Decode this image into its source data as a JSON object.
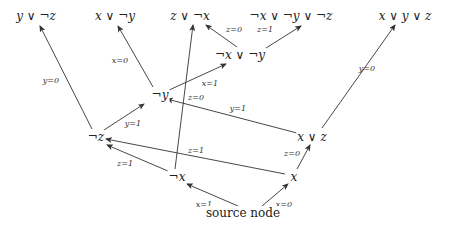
{
  "diagram": {
    "type": "decision-graph",
    "nodes": [
      {
        "id": "n_y_or_notz",
        "label": "y ∨ ¬z",
        "x": 36,
        "y": 16
      },
      {
        "id": "n_x_or_noty",
        "label": "x ∨ ¬y",
        "x": 115,
        "y": 16
      },
      {
        "id": "n_z_or_notx",
        "label": "z ∨ ¬x",
        "x": 190,
        "y": 16
      },
      {
        "id": "n_notx_noty_notz",
        "label": "¬x ∨ ¬y ∨ ¬z",
        "x": 291,
        "y": 16
      },
      {
        "id": "n_x_y_z",
        "label": "x ∨ y ∨ z",
        "x": 405,
        "y": 16
      },
      {
        "id": "n_notx_noty",
        "label": "¬x ∨ ¬y",
        "x": 240,
        "y": 55
      },
      {
        "id": "n_noty",
        "label": "¬y",
        "x": 160,
        "y": 95
      },
      {
        "id": "n_x_or_z",
        "label": "x ∨ z",
        "x": 312,
        "y": 137
      },
      {
        "id": "n_notz",
        "label": "¬z",
        "x": 96,
        "y": 137
      },
      {
        "id": "n_x",
        "label": "x",
        "x": 294,
        "y": 177
      },
      {
        "id": "n_notx",
        "label": "¬x",
        "x": 177,
        "y": 177
      },
      {
        "id": "n_source",
        "label": "source node",
        "x": 243,
        "y": 213,
        "plain": true
      }
    ],
    "edges": [
      {
        "from": "n_source",
        "to": "n_notx",
        "label": "x=1",
        "x1": 238,
        "y1": 206,
        "x2": 187,
        "y2": 184,
        "lx": 204,
        "ly": 205
      },
      {
        "from": "n_source",
        "to": "n_x",
        "label": "x=0",
        "x1": 262,
        "y1": 206,
        "x2": 288,
        "y2": 184,
        "lx": 284,
        "ly": 205
      },
      {
        "from": "n_x",
        "to": "n_x_or_z",
        "label": "z=0",
        "x1": 297,
        "y1": 169,
        "x2": 310,
        "y2": 145,
        "lx": 292,
        "ly": 154
      },
      {
        "from": "n_notx",
        "to": "n_notz",
        "label": "z=1",
        "x1": 168,
        "y1": 171,
        "x2": 107,
        "y2": 145,
        "lx": 125,
        "ly": 164
      },
      {
        "from": "n_x",
        "to": "n_notz",
        "label": "z=1",
        "x1": 285,
        "y1": 174,
        "x2": 106,
        "y2": 139,
        "lx": 196,
        "ly": 151
      },
      {
        "from": "n_notx",
        "to": "n_z_or_notx",
        "label": "",
        "x1": 175,
        "y1": 169,
        "x2": 193,
        "y2": 25,
        "lx": 0,
        "ly": 0
      },
      {
        "from": "n_notz",
        "to": "n_noty",
        "label": "y=1",
        "x1": 104,
        "y1": 130,
        "x2": 144,
        "y2": 104,
        "lx": 133,
        "ly": 124
      },
      {
        "from": "n_notz",
        "to": "n_y_or_notz",
        "label": "y=0",
        "x1": 92,
        "y1": 129,
        "x2": 40,
        "y2": 26,
        "lx": 51,
        "ly": 81
      },
      {
        "from": "n_x_or_z",
        "to": "n_noty",
        "label": "y=1",
        "x1": 297,
        "y1": 133,
        "x2": 167,
        "y2": 99,
        "lx": 238,
        "ly": 109
      },
      {
        "from": "n_x_or_z",
        "to": "n_x_y_z",
        "label": "y=0",
        "x1": 322,
        "y1": 128,
        "x2": 395,
        "y2": 25,
        "lx": 367,
        "ly": 69
      },
      {
        "from": "n_noty",
        "to": "n_x_or_noty",
        "label": "x=0",
        "x1": 153,
        "y1": 87,
        "x2": 118,
        "y2": 26,
        "lx": 120,
        "ly": 61
      },
      {
        "from": "n_noty",
        "to": "n_notx_noty",
        "label": "x=1",
        "x1": 167,
        "y1": 91,
        "x2": 226,
        "y2": 64,
        "lx": 210,
        "ly": 84
      },
      {
        "from": "n_notx_noty",
        "to": "n_z_or_notx",
        "label": "z=0",
        "x1": 237,
        "y1": 47,
        "x2": 206,
        "y2": 25,
        "lx": 234,
        "ly": 30
      },
      {
        "from": "n_notx_noty",
        "to": "n_notx_noty_notz",
        "label": "z=1",
        "x1": 266,
        "y1": 48,
        "x2": 301,
        "y2": 26,
        "lx": 265,
        "ly": 30
      }
    ],
    "extra_labels": [
      {
        "label": "z=0",
        "x": 196,
        "y": 98
      }
    ]
  },
  "colors": {
    "line": "#333333",
    "text": "#222222",
    "background": "#ffffff"
  }
}
